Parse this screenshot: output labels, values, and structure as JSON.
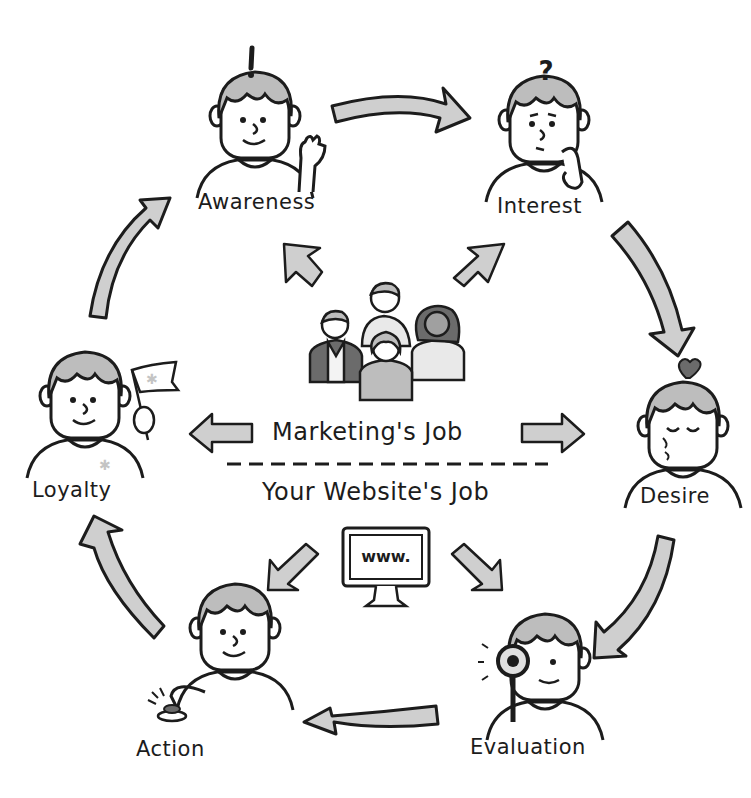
{
  "diagram": {
    "stages": [
      {
        "id": "awareness",
        "label": "Awareness",
        "symbol": "!"
      },
      {
        "id": "interest",
        "label": "Interest",
        "symbol": "?"
      },
      {
        "id": "desire",
        "label": "Desire",
        "symbol": "heart"
      },
      {
        "id": "evaluation",
        "label": "Evaluation",
        "symbol": "magnifying-glass"
      },
      {
        "id": "action",
        "label": "Action",
        "symbol": "push-button"
      },
      {
        "id": "loyalty",
        "label": "Loyalty",
        "symbol": "flag"
      }
    ],
    "center": {
      "marketing_job": "Marketing's Job",
      "website_job": "Your Website's Job",
      "monitor_text": "www."
    },
    "colors": {
      "ink": "#1c1c1c",
      "arrow_fill": "#cfcfcf",
      "hair_fill": "#bdbdbd",
      "background": "#ffffff"
    }
  }
}
